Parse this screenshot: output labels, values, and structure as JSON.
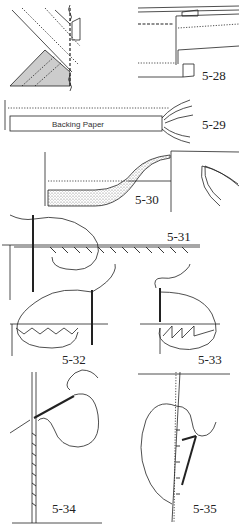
{
  "figures": [
    {
      "id": "fig-5-27",
      "label": ""
    },
    {
      "id": "fig-5-28",
      "label": "5-28"
    },
    {
      "id": "fig-5-29",
      "label": "5-29",
      "text": "Backing Paper"
    },
    {
      "id": "fig-5-30",
      "label": "5-30"
    },
    {
      "id": "fig-5-31",
      "label": "5-31"
    },
    {
      "id": "fig-5-32",
      "label": "5-32"
    },
    {
      "id": "fig-5-33",
      "label": "5-33"
    },
    {
      "id": "fig-5-34",
      "label": "5-34"
    },
    {
      "id": "fig-5-35",
      "label": "5-35"
    }
  ],
  "colors": {
    "ink": "#222222",
    "background": "#ffffff"
  }
}
